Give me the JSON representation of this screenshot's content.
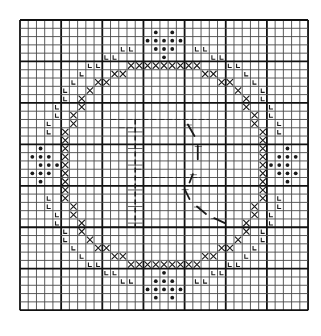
{
  "pattern": {
    "title": "Cross-stitch chart: letter R monogram in cross-stitch ring",
    "grid": {
      "cols": 35,
      "rows": 35,
      "origin_x": 20,
      "origin_y": 20,
      "cell_w": 8.23,
      "cell_h": 8.29,
      "major_every": 5
    },
    "colors": {
      "background": "#ffffff",
      "grid_minor": "#4a4a4a",
      "grid_major": "#111111",
      "symbol": "#1a1a1a"
    },
    "legend_symbols": [
      {
        "symbol": "cross-x",
        "meaning": "ring stitch"
      },
      {
        "symbol": "L",
        "meaning": "outer accent stitch"
      },
      {
        "symbol": "dot",
        "meaning": "flower motif stitch"
      },
      {
        "symbol": "backstitch",
        "meaning": "letter outline"
      }
    ],
    "letter": "R",
    "ring_octant": [
      [
        5,
        13
      ],
      [
        5,
        14
      ],
      [
        5,
        15
      ],
      [
        5,
        16
      ],
      [
        5,
        17
      ],
      [
        6,
        11
      ],
      [
        6,
        12
      ],
      [
        7,
        9
      ],
      [
        7,
        10
      ],
      [
        8,
        8
      ],
      [
        9,
        7
      ],
      [
        10,
        7
      ],
      [
        11,
        6
      ],
      [
        12,
        6
      ],
      [
        13,
        5
      ],
      [
        14,
        5
      ],
      [
        15,
        5
      ],
      [
        16,
        5
      ],
      [
        17,
        5
      ]
    ],
    "l_marks_quadrant": [
      [
        3,
        12
      ],
      [
        3,
        13
      ],
      [
        4,
        10
      ],
      [
        4,
        11
      ],
      [
        5,
        8
      ],
      [
        5,
        9
      ],
      [
        6,
        7
      ],
      [
        7,
        6
      ],
      [
        8,
        5
      ],
      [
        9,
        5
      ],
      [
        10,
        4
      ],
      [
        11,
        4
      ],
      [
        12,
        3
      ],
      [
        13,
        3
      ]
    ],
    "dot_motifs": {
      "top": [
        [
          1,
          16
        ],
        [
          1,
          18
        ],
        [
          2,
          15
        ],
        [
          2,
          16
        ],
        [
          2,
          17
        ],
        [
          2,
          18
        ],
        [
          2,
          19
        ],
        [
          3,
          16
        ],
        [
          3,
          17
        ],
        [
          3,
          18
        ],
        [
          4,
          17
        ]
      ],
      "bottom": [
        [
          30,
          17
        ],
        [
          31,
          16
        ],
        [
          31,
          17
        ],
        [
          31,
          18
        ],
        [
          32,
          15
        ],
        [
          32,
          16
        ],
        [
          32,
          17
        ],
        [
          32,
          18
        ],
        [
          32,
          19
        ],
        [
          33,
          16
        ],
        [
          33,
          18
        ]
      ],
      "left": [
        [
          15,
          2
        ],
        [
          16,
          1
        ],
        [
          16,
          2
        ],
        [
          16,
          3
        ],
        [
          17,
          2
        ],
        [
          17,
          3
        ],
        [
          17,
          4
        ],
        [
          18,
          1
        ],
        [
          18,
          2
        ],
        [
          18,
          3
        ],
        [
          19,
          2
        ]
      ],
      "right": [
        [
          15,
          32
        ],
        [
          16,
          31
        ],
        [
          16,
          32
        ],
        [
          16,
          33
        ],
        [
          17,
          30
        ],
        [
          17,
          31
        ],
        [
          17,
          32
        ],
        [
          18,
          31
        ],
        [
          18,
          32
        ],
        [
          18,
          33
        ],
        [
          19,
          32
        ]
      ]
    },
    "backstitch_R": {
      "h_lines": [
        [
          12,
          11,
          23
        ],
        [
          13,
          12,
          14
        ],
        [
          19,
          14,
          22
        ],
        [
          25,
          11,
          15
        ],
        [
          18,
          14,
          15
        ]
      ],
      "v_lines": [
        [
          14,
          12,
          25
        ],
        [
          13,
          13,
          25
        ]
      ],
      "diagonals": [
        [
          20.4,
          12.6,
          21.2,
          14.0
        ],
        [
          21.6,
          15.2,
          21.6,
          16.8
        ],
        [
          21.0,
          18.6,
          20.6,
          19.6
        ],
        [
          20.0,
          20.4,
          20.6,
          21.6
        ],
        [
          21.5,
          22.5,
          22.6,
          23.4
        ],
        [
          23.6,
          23.9,
          24.9,
          24.5
        ]
      ],
      "stem_ticks": [
        13.5,
        15.5,
        17.5,
        20.5,
        22.5,
        24.5
      ]
    }
  }
}
